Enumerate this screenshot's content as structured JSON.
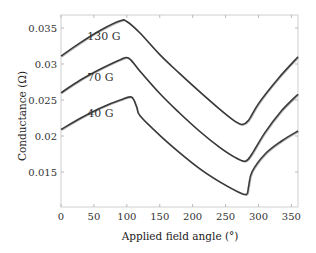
{
  "chart_data": {
    "type": "line",
    "title": "",
    "xlabel": "Applied field angle (°)",
    "ylabel": "Conductance (Ω)",
    "xlim": [
      0,
      360
    ],
    "ylim": [
      0.0105,
      0.0372
    ],
    "xticks": [
      0,
      50,
      100,
      150,
      200,
      250,
      300,
      350
    ],
    "yticks": [
      0.015,
      0.02,
      0.025,
      0.03,
      0.035
    ],
    "ytick_labels": [
      "0.015",
      "0.02",
      "0.025",
      "0.03",
      "0.035"
    ],
    "grid": false,
    "legend": "inline labels",
    "series": [
      {
        "name": "130 G",
        "label_pos": [
          40,
          0.0334
        ],
        "x": [
          0,
          30,
          60,
          90,
          100,
          120,
          150,
          180,
          210,
          240,
          265,
          275,
          285,
          300,
          330,
          360
        ],
        "values": [
          0.0311,
          0.033,
          0.0347,
          0.036,
          0.0359,
          0.0343,
          0.0313,
          0.0287,
          0.0262,
          0.0238,
          0.022,
          0.0216,
          0.0222,
          0.0245,
          0.028,
          0.031
        ]
      },
      {
        "name": "70 G",
        "label_pos": [
          40,
          0.0277
        ],
        "x": [
          0,
          30,
          60,
          90,
          103,
          120,
          150,
          180,
          210,
          240,
          265,
          280,
          290,
          310,
          335,
          360
        ],
        "values": [
          0.026,
          0.0278,
          0.0293,
          0.0306,
          0.0308,
          0.029,
          0.0259,
          0.0232,
          0.0207,
          0.0185,
          0.017,
          0.0165,
          0.0175,
          0.0205,
          0.0235,
          0.0258
        ]
      },
      {
        "name": "40 G",
        "label_pos": [
          40,
          0.0226
        ],
        "x": [
          0,
          30,
          60,
          90,
          107,
          115,
          120,
          150,
          180,
          210,
          240,
          270,
          282,
          285,
          290,
          310,
          335,
          360
        ],
        "values": [
          0.0209,
          0.0225,
          0.0239,
          0.025,
          0.0254,
          0.024,
          0.0228,
          0.0201,
          0.0177,
          0.0155,
          0.0137,
          0.0122,
          0.0119,
          0.013,
          0.015,
          0.0175,
          0.0193,
          0.0207
        ]
      }
    ]
  }
}
